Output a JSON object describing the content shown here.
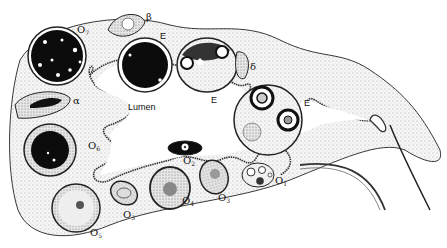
{
  "figure": {
    "colors": {
      "ink": "#111111",
      "stipple": "#9a9a9a",
      "background": "#ffffff",
      "tissue": "#f4f4f4"
    },
    "labels": {
      "lumen": "Lumen",
      "o1": {
        "base": "O",
        "sub": "1"
      },
      "o2": {
        "base": "O",
        "sub": "2"
      },
      "o3a": {
        "base": "O",
        "sub": "3"
      },
      "o3b": {
        "base": "O",
        "sub": "3"
      },
      "o4": {
        "base": "O",
        "sub": "4"
      },
      "o5": {
        "base": "O",
        "sub": "5"
      },
      "o6": {
        "base": "O",
        "sub": "6"
      },
      "o7": {
        "base": "O",
        "sub": "7"
      },
      "alpha": "α",
      "beta": "β",
      "delta": "δ",
      "e1": "E",
      "e2": "E",
      "e3": "E"
    }
  }
}
